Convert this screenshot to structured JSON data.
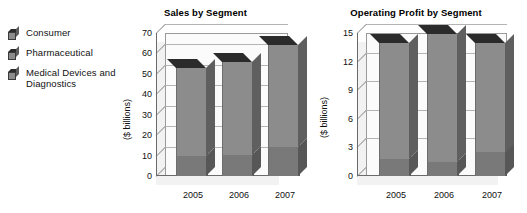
{
  "legend": {
    "items": [
      {
        "label": "Consumer",
        "icon": "cube-icon",
        "color": "#8c8c8c"
      },
      {
        "label": "Pharmaceutical",
        "icon": "cube-icon",
        "color": "#8c8c8c"
      },
      {
        "label": "Medical Devices and Diagnostics",
        "icon": "cube-icon",
        "color": "#8c8c8c"
      }
    ]
  },
  "charts": {
    "sales": {
      "title": "Sales by Segment",
      "ylabel": "($ billions)",
      "yticks": [
        "70",
        "60",
        "50",
        "40",
        "30",
        "20",
        "10",
        "0"
      ],
      "xticks": [
        "2005",
        "2006",
        "2007"
      ]
    },
    "profit": {
      "title": "Operating Profit by Segment",
      "ylabel": "($ billions)",
      "yticks": [
        "15",
        "12",
        "9",
        "6",
        "3",
        "0"
      ],
      "xticks": [
        "2005",
        "2006",
        "2007"
      ]
    }
  },
  "chart_data": [
    {
      "type": "bar",
      "subtype": "stacked-column-3d",
      "title": "Sales by Segment",
      "xlabel": "",
      "ylabel": "($ billions)",
      "categories": [
        "2005",
        "2006",
        "2007"
      ],
      "ylim": [
        0,
        70
      ],
      "ytick_values": [
        0,
        10,
        20,
        30,
        40,
        50,
        60,
        70
      ],
      "grid": true,
      "legend_position": "left-outside",
      "series": [
        {
          "name": "Consumer",
          "values": [
            10.0,
            10.5,
            14.0
          ]
        },
        {
          "name": "Pharmaceutical",
          "values": [
            43.0,
            45.5,
            50.0
          ]
        },
        {
          "name": "Medical Devices and Diagnostics",
          "values": [
            0,
            0,
            0
          ]
        }
      ],
      "totals": [
        53.0,
        56.0,
        64.0
      ]
    },
    {
      "type": "bar",
      "subtype": "stacked-column-3d",
      "title": "Operating Profit by Segment",
      "xlabel": "",
      "ylabel": "($ billions)",
      "categories": [
        "2005",
        "2006",
        "2007"
      ],
      "ylim": [
        0,
        15
      ],
      "ytick_values": [
        0,
        3,
        6,
        9,
        12,
        15
      ],
      "grid": true,
      "legend_position": "left-outside",
      "series": [
        {
          "name": "Consumer",
          "values": [
            1.8,
            1.5,
            2.5
          ]
        },
        {
          "name": "Pharmaceutical",
          "values": [
            12.2,
            13.4,
            11.5
          ]
        },
        {
          "name": "Medical Devices and Diagnostics",
          "values": [
            0,
            0,
            0
          ]
        }
      ],
      "totals": [
        14.0,
        14.9,
        14.0
      ]
    }
  ],
  "colors": {
    "segment_upper": "#8c8c8c",
    "segment_lower": "#797979",
    "bar_cap": "#2b2b2b",
    "bar_side": "#5f5f5f",
    "grid": "#b4b4b4",
    "axis": "#6a6a6a",
    "plot_background": "#fbfbfb",
    "floor": "#f2f2f2"
  }
}
